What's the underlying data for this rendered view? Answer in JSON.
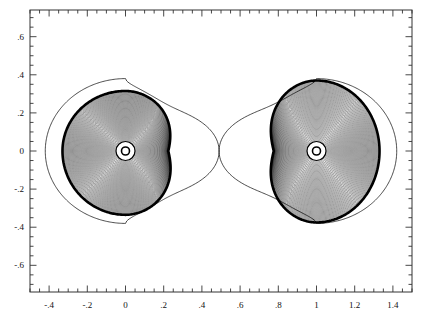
{
  "figure": {
    "background_color": "#ffffff",
    "frame_color": "#333333",
    "curve_color": "#000000",
    "plot_box_px": {
      "left": 30,
      "top": 10,
      "right": 412,
      "bottom": 292
    }
  },
  "axes": {
    "x": {
      "label": "",
      "min": -0.5,
      "max": 1.5,
      "major_ticks": [
        -0.4,
        -0.2,
        0,
        0.2,
        0.4,
        0.6,
        0.8,
        1,
        1.2,
        1.4
      ],
      "major_tick_labels": [
        "-.4",
        "-.2",
        "0",
        ".2",
        ".4",
        ".6",
        ".8",
        "1",
        "1.2",
        "1.4"
      ],
      "minor_tick_step": 0.05
    },
    "y": {
      "label": "",
      "min": -0.74,
      "max": 0.74,
      "major_ticks": [
        0.6,
        0.4,
        0.2,
        0,
        -0.2,
        -0.4,
        -0.6
      ],
      "major_tick_labels": [
        ".6",
        ".4",
        ".2",
        "0",
        "-.2",
        "-.4",
        "-.6"
      ],
      "minor_tick_step": 0.05
    }
  },
  "chart_data": {
    "type": "line",
    "title": "",
    "xlabel": "",
    "ylabel": "",
    "xlim": [
      -0.5,
      1.5
    ],
    "ylim": [
      -0.74,
      0.74
    ],
    "grid": false,
    "legend": null,
    "markers": [
      {
        "name": "primary-center",
        "x": 0.0,
        "y": 0.0,
        "symbol": "o"
      },
      {
        "name": "secondary-center",
        "x": 1.0,
        "y": 0.0,
        "symbol": "o"
      }
    ],
    "lagrange_point": {
      "name": "L1",
      "x": 0.49,
      "y": 0.0
    },
    "series": [
      {
        "name": "critical-figure-eight",
        "style": "thin",
        "lobes": [
          {
            "center_x": 0.0,
            "x_inner": 0.49,
            "x_outer": -0.42,
            "y_max": 0.38,
            "y_min": -0.38
          },
          {
            "center_x": 1.0,
            "x_inner": 0.49,
            "x_outer": 1.42,
            "y_max": 0.38,
            "y_min": -0.38
          }
        ]
      },
      {
        "name": "bold-boundary-left",
        "style": "thick",
        "center_x": 0.0,
        "x_outer": -0.33,
        "x_inner": 0.32,
        "y_max": 0.315,
        "y_min": -0.335
      },
      {
        "name": "bold-boundary-right",
        "style": "thick",
        "center_x": 1.0,
        "x_outer": 1.33,
        "x_inner": 0.68,
        "y_max": 0.37,
        "y_min": -0.375
      },
      {
        "name": "nested-contours-left",
        "style": "thin",
        "center_x": 0.0,
        "count": 58,
        "inner_radius": 0.033,
        "outer_radius": 0.32
      },
      {
        "name": "nested-contours-right",
        "style": "thin",
        "center_x": 1.0,
        "count": 58,
        "inner_radius": 0.033,
        "outer_radius": 0.345
      }
    ]
  }
}
